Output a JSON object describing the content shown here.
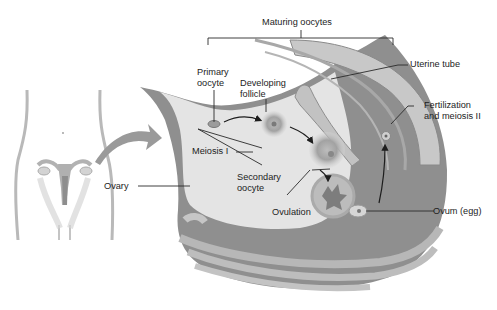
{
  "diagram": {
    "type": "anatomical-illustration",
    "color_scheme": "grayscale",
    "colors": {
      "background": "#ffffff",
      "ovary_fill": "#e4e4e4",
      "ovary_wall": "#8f8f8f",
      "tube_fill": "#c8c8c8",
      "follicle": "#9a9a9a",
      "text": "#1d1d1d",
      "leader_lines": "#2a2a2a"
    }
  },
  "labels": {
    "maturing_oocytes": "Maturing oocytes",
    "uterine_tube": "Uterine tube",
    "primary_oocyte_line1": "Primary",
    "primary_oocyte_line2": "oocyte",
    "developing_follicle_line1": "Developing",
    "developing_follicle_line2": "follicle",
    "fertilization_line1": "Fertilization",
    "fertilization_line2": "and meiosis II",
    "meiosis_i": "Meiosis I",
    "secondary_oocyte_line1": "Secondary",
    "secondary_oocyte_line2": "oocyte",
    "ovary": "Ovary",
    "ovulation": "Ovulation",
    "ovum": "Ovum (egg)"
  }
}
